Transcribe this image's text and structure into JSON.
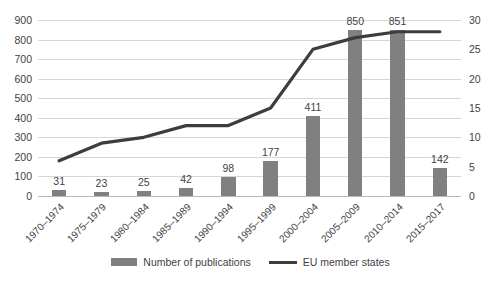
{
  "chart_data": {
    "type": "bar",
    "title": "",
    "subtitle": "",
    "xlabel": "",
    "ylabel": "",
    "grid": true,
    "legend_position": "bottom",
    "categories": [
      "1970–1974",
      "1975–1979",
      "1980–1984",
      "1985–1989",
      "1990–1994",
      "1995–1999",
      "2000–2004",
      "2005–2009",
      "2010–2014",
      "2015–2017"
    ],
    "series": [
      {
        "name": "Number of publications",
        "type": "bar",
        "axis": "left",
        "color": "#808080",
        "values": [
          31,
          23,
          25,
          42,
          98,
          177,
          411,
          850,
          851,
          142
        ]
      },
      {
        "name": "EU member states",
        "type": "line",
        "axis": "right",
        "color": "#3d3d3d",
        "values": [
          6,
          9,
          10,
          12,
          12,
          15,
          25,
          27,
          28,
          28
        ]
      }
    ],
    "y_left": {
      "label": "",
      "min": 0,
      "max": 900,
      "step": 100,
      "ticks": [
        "0",
        "100",
        "200",
        "300",
        "400",
        "500",
        "600",
        "700",
        "800",
        "900"
      ]
    },
    "y_right": {
      "label": "",
      "min": 0,
      "max": 30,
      "step": 5,
      "ticks": [
        "0",
        "5",
        "10",
        "15",
        "20",
        "25",
        "30"
      ]
    },
    "data_labels": [
      "31",
      "23",
      "25",
      "42",
      "98",
      "177",
      "411",
      "850",
      "851",
      "142"
    ]
  },
  "legend": {
    "bar_label": "Number of publications",
    "line_label": "EU member states"
  }
}
